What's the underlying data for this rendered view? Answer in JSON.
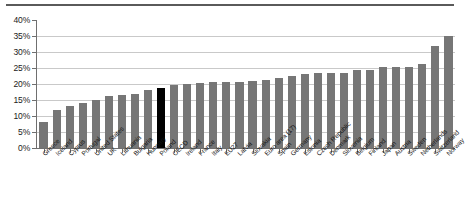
{
  "chart_data": {
    "type": "bar",
    "title": "",
    "subtitle": "",
    "xlabel": "",
    "ylabel": "",
    "ylim": [
      0,
      40
    ],
    "ytick_labels": [
      "40%",
      "35%",
      "30%",
      "25%",
      "20%",
      "15%",
      "10%",
      "5%",
      "0%"
    ],
    "ytick_values": [
      40,
      35,
      30,
      25,
      20,
      15,
      10,
      5,
      0
    ],
    "grid": true,
    "legend": "none",
    "highlight_category": "Poland",
    "highlight_color": "#000000",
    "bar_color": "#767676",
    "categories": [
      "Greece",
      "Iceland",
      "Cyprus",
      "Portugal",
      "United States",
      "UK",
      "Lithuania",
      "Bulgaria",
      "Hungary",
      "Poland",
      "OECD",
      "Ireland",
      "France",
      "Italy",
      "EU27",
      "Latvia",
      "Slovakia",
      "Euro area (17)",
      "Spain",
      "Germany",
      "Estonia",
      "Czech Republic",
      "Denmark",
      "Slovenia",
      "Belgium",
      "Finland",
      "Japan",
      "Austria",
      "Sweden",
      "Netherlands",
      "Switzerland",
      "Norway"
    ],
    "values": [
      8.1,
      11.8,
      13.1,
      14.0,
      15.0,
      16.3,
      16.5,
      17.0,
      18.0,
      18.6,
      19.6,
      20.0,
      20.2,
      20.5,
      20.6,
      20.7,
      21.0,
      21.3,
      22.0,
      22.5,
      23.2,
      23.4,
      23.5,
      23.5,
      24.3,
      24.5,
      25.3,
      25.4,
      25.4,
      26.3,
      31.8,
      35.0
    ]
  }
}
